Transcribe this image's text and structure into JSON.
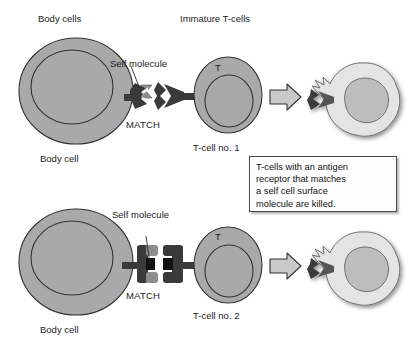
{
  "figure": {
    "headings": {
      "left": "Body cells",
      "right": "Immature T-cells"
    },
    "caption": {
      "lines": [
        "T-cells with an antigen",
        "receptor that matches",
        "a self cell surface",
        "molecule are killed."
      ],
      "text": "T-cells with an antigen receptor that matches a self cell surface molecule are killed."
    },
    "colors": {
      "cell_fill": "#a9a9a9",
      "cell_stroke": "#333333",
      "nucleus_stroke": "#333333",
      "receptor_dark": "#3a3a3a",
      "receptor_mid": "#8d8d8d",
      "killed_fill": "#e4e4e4",
      "killed_nucleus": "#bdbdbd",
      "arrow_fill": "#c9c9c9",
      "arrow_stroke": "#333333",
      "background": "#ffffff",
      "text": "#1a1a1a"
    },
    "rows": [
      {
        "id": "row-1",
        "body_cell_label": "Body cell",
        "self_molecule_label": "Self molecule",
        "match_label": "MATCH",
        "tcell_mark": "T",
        "tcell_label": "T-cell no. 1",
        "receptor_style": "trident-arrow",
        "outcome": "killed"
      },
      {
        "id": "row-2",
        "body_cell_label": "Body cell",
        "self_molecule_label": "Self molecule",
        "match_label": "MATCH",
        "tcell_mark": "T",
        "tcell_label": "T-cell no. 2",
        "receptor_style": "square-bracket",
        "outcome": "killed"
      }
    ]
  }
}
